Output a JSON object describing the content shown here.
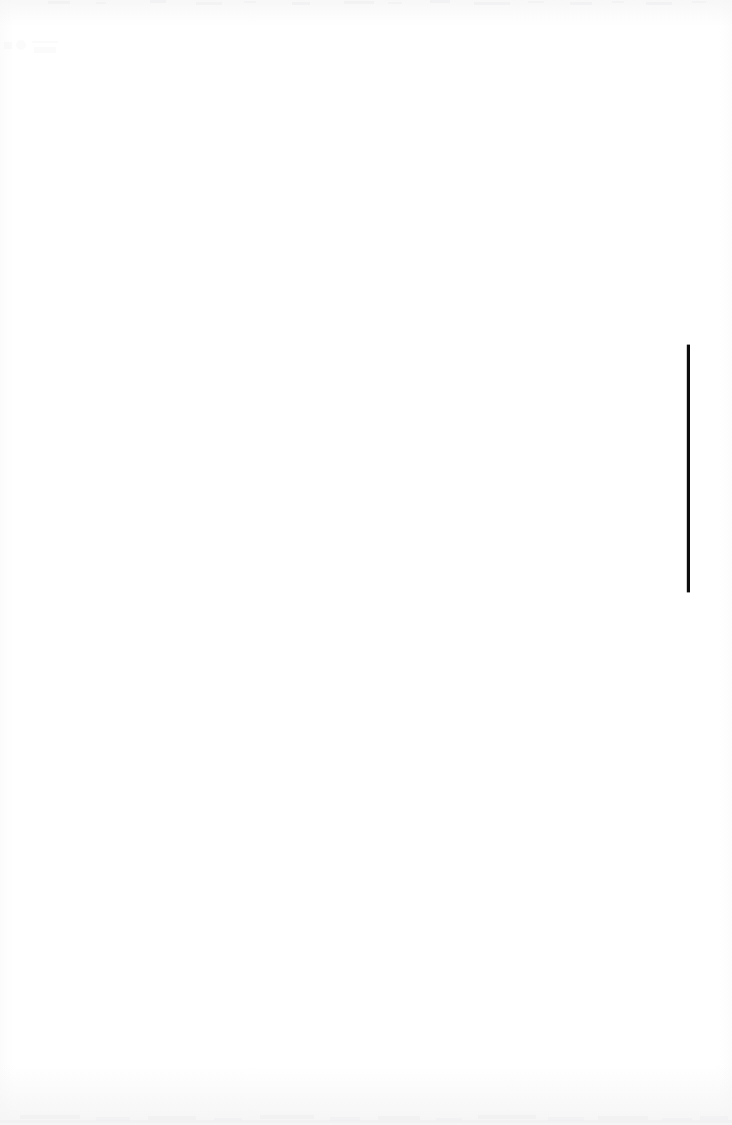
{
  "document": {
    "kind": "scanned-page",
    "page_label": "",
    "background_color": "#ffffff",
    "ink_color": "#0d0d0d",
    "width_px": 732,
    "height_px": 1125,
    "visible_text": "",
    "note": ""
  },
  "graphic": {
    "name": "step-rule",
    "type": "polyline",
    "stroke_color": "#0d0d0d",
    "stroke_width_px": 3,
    "description": "Single black step-shaped rule: short horizontal segment at upper right, vertical drop, long horizontal segment running off the left edge",
    "points": [
      {
        "x": 732,
        "y": 346
      },
      {
        "x": 688,
        "y": 346
      },
      {
        "x": 688,
        "y": 591
      },
      {
        "x": 0,
        "y": 591
      }
    ],
    "segments": [
      {
        "name": "top-horizontal-segment",
        "orientation": "horizontal",
        "x_start": 688,
        "x_end": 732,
        "y": 346,
        "fades_at_right_edge": true
      },
      {
        "name": "vertical-segment",
        "orientation": "vertical",
        "x": 688,
        "y_start": 346,
        "y_end": 591
      },
      {
        "name": "bottom-horizontal-segment",
        "orientation": "horizontal",
        "x_start": 0,
        "x_end": 688,
        "y": 591,
        "bleeds_off_left_edge": true
      }
    ],
    "corners": [
      {
        "name": "top-right-corner",
        "x": 688,
        "y": 346,
        "type": "miter"
      },
      {
        "name": "bottom-right-corner",
        "x": 688,
        "y": 591,
        "type": "miter"
      }
    ]
  },
  "artifacts": {
    "top_edge_speckle": "faint gray scan noise along top margin",
    "bottom_edge_speckle": "faint gray scan noise along bottom margin",
    "upper_left_ghost": "extremely faint ghost mark near x=10-50, y=40-55"
  }
}
